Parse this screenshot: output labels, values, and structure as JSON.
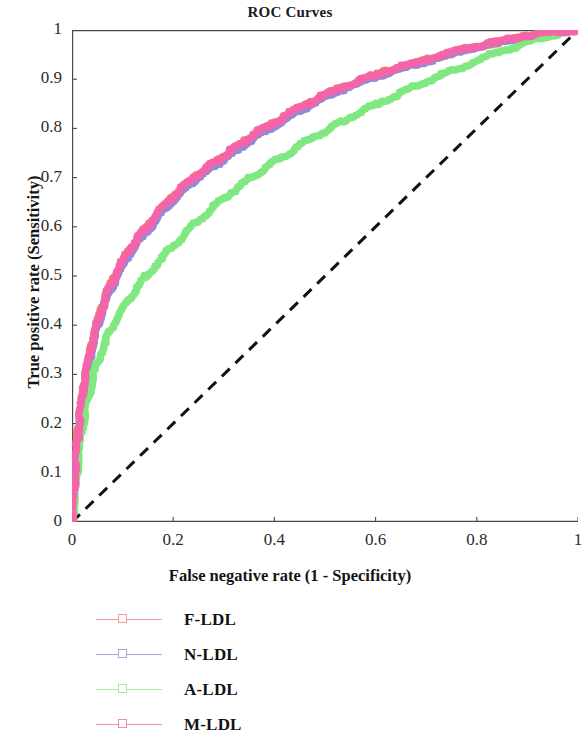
{
  "chart_data": {
    "type": "line",
    "title": "ROC Curves",
    "xlabel": "False negative rate (1 - Specificity)",
    "ylabel": "True positive rate (Sensitivity)",
    "xlim": [
      0,
      1
    ],
    "ylim": [
      0,
      1
    ],
    "grid": false,
    "legend_position": "below-left",
    "xticks": [
      "0",
      "0.2",
      "0.4",
      "0.6",
      "0.8",
      "1"
    ],
    "xtick_values": [
      0,
      0.2,
      0.4,
      0.6,
      0.8,
      1
    ],
    "yticks": [
      "0",
      "0.1",
      "0.2",
      "0.3",
      "0.4",
      "0.5",
      "0.6",
      "0.7",
      "0.8",
      "0.9",
      "1"
    ],
    "ytick_values": [
      0,
      0.1,
      0.2,
      0.3,
      0.4,
      0.5,
      0.6,
      0.7,
      0.8,
      0.9,
      1
    ],
    "reference_line": {
      "name": "chance-diagonal",
      "style": "dashed",
      "color": "#111111",
      "x": [
        0,
        1
      ],
      "y": [
        0,
        1
      ]
    },
    "series": [
      {
        "name": "F-LDL",
        "color": "#F4756E",
        "legend_line_color": "#F29C9C",
        "x": [
          0,
          0.004,
          0.008,
          0.012,
          0.018,
          0.025,
          0.034,
          0.045,
          0.058,
          0.072,
          0.09,
          0.11,
          0.132,
          0.157,
          0.185,
          0.212,
          0.242,
          0.272,
          0.3,
          0.33,
          0.365,
          0.4,
          0.44,
          0.48,
          0.52,
          0.57,
          0.62,
          0.67,
          0.72,
          0.78,
          0.84,
          0.9,
          0.95,
          1.0
        ],
        "y": [
          0,
          0.06,
          0.12,
          0.18,
          0.235,
          0.285,
          0.335,
          0.385,
          0.43,
          0.47,
          0.51,
          0.545,
          0.578,
          0.61,
          0.645,
          0.672,
          0.7,
          0.722,
          0.742,
          0.765,
          0.79,
          0.81,
          0.835,
          0.857,
          0.877,
          0.897,
          0.915,
          0.93,
          0.945,
          0.962,
          0.975,
          0.988,
          0.995,
          1.0
        ]
      },
      {
        "name": "N-LDL",
        "color": "#8C8CD8",
        "legend_line_color": "#A5A5DE",
        "x": [
          0,
          0.004,
          0.008,
          0.013,
          0.019,
          0.026,
          0.035,
          0.046,
          0.059,
          0.074,
          0.092,
          0.112,
          0.134,
          0.16,
          0.188,
          0.215,
          0.245,
          0.275,
          0.303,
          0.333,
          0.368,
          0.403,
          0.443,
          0.483,
          0.523,
          0.573,
          0.623,
          0.673,
          0.723,
          0.783,
          0.843,
          0.903,
          0.952,
          1.0
        ],
        "y": [
          0,
          0.058,
          0.118,
          0.177,
          0.232,
          0.282,
          0.332,
          0.382,
          0.427,
          0.467,
          0.507,
          0.542,
          0.575,
          0.607,
          0.642,
          0.669,
          0.697,
          0.719,
          0.739,
          0.762,
          0.787,
          0.807,
          0.832,
          0.855,
          0.875,
          0.895,
          0.913,
          0.928,
          0.943,
          0.96,
          0.974,
          0.987,
          0.994,
          1.0
        ]
      },
      {
        "name": "A-LDL",
        "color": "#7FE87F",
        "legend_line_color": "#A9E8A9",
        "x": [
          0,
          0.005,
          0.01,
          0.016,
          0.023,
          0.032,
          0.043,
          0.056,
          0.072,
          0.09,
          0.112,
          0.136,
          0.163,
          0.192,
          0.222,
          0.253,
          0.285,
          0.317,
          0.35,
          0.385,
          0.42,
          0.458,
          0.497,
          0.537,
          0.578,
          0.62,
          0.665,
          0.71,
          0.758,
          0.81,
          0.862,
          0.912,
          0.957,
          1.0
        ],
        "y": [
          0,
          0.052,
          0.105,
          0.158,
          0.208,
          0.255,
          0.3,
          0.342,
          0.382,
          0.418,
          0.452,
          0.486,
          0.52,
          0.552,
          0.585,
          0.615,
          0.645,
          0.672,
          0.697,
          0.722,
          0.745,
          0.77,
          0.793,
          0.815,
          0.838,
          0.858,
          0.88,
          0.9,
          0.92,
          0.942,
          0.962,
          0.98,
          0.992,
          1.0
        ]
      },
      {
        "name": "M-LDL",
        "color": "#F564A9",
        "legend_line_color": "#F08CBA",
        "x": [
          0,
          0.004,
          0.008,
          0.012,
          0.018,
          0.025,
          0.034,
          0.045,
          0.058,
          0.072,
          0.09,
          0.11,
          0.132,
          0.157,
          0.185,
          0.212,
          0.242,
          0.272,
          0.3,
          0.33,
          0.365,
          0.4,
          0.44,
          0.48,
          0.52,
          0.57,
          0.62,
          0.67,
          0.72,
          0.78,
          0.84,
          0.9,
          0.95,
          1.0
        ],
        "y": [
          0,
          0.062,
          0.122,
          0.182,
          0.238,
          0.288,
          0.338,
          0.388,
          0.432,
          0.472,
          0.512,
          0.547,
          0.58,
          0.612,
          0.647,
          0.674,
          0.702,
          0.724,
          0.744,
          0.767,
          0.792,
          0.812,
          0.837,
          0.858,
          0.878,
          0.898,
          0.916,
          0.931,
          0.946,
          0.963,
          0.976,
          0.989,
          0.996,
          1.0
        ]
      }
    ]
  },
  "legend": {
    "items": [
      {
        "label": "F-LDL"
      },
      {
        "label": "N-LDL"
      },
      {
        "label": "A-LDL"
      },
      {
        "label": "M-LDL"
      }
    ]
  }
}
